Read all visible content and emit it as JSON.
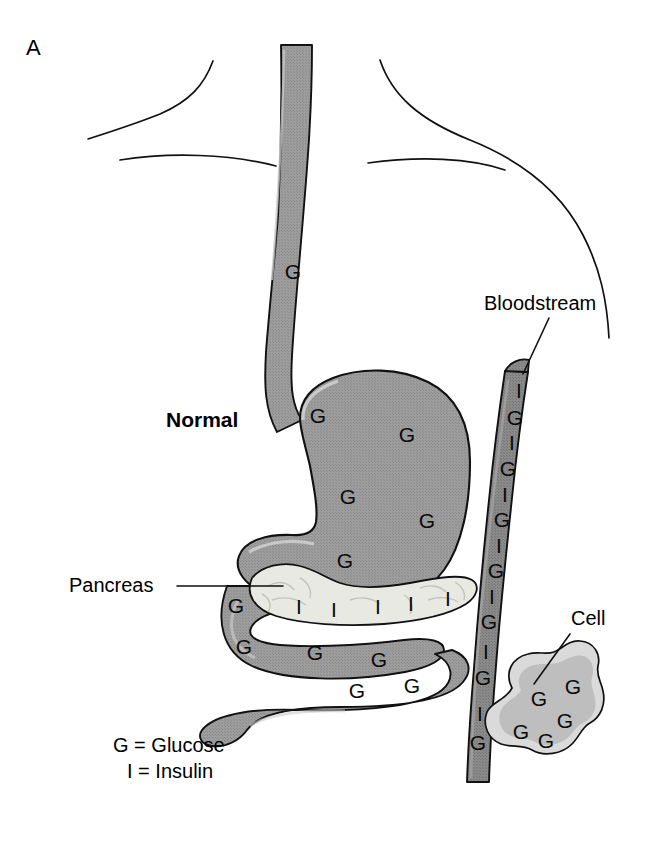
{
  "figure": {
    "panel_letter": "A",
    "condition_label": "Normal",
    "background_color": "#ffffff",
    "line_color": "#111111"
  },
  "labels": {
    "pancreas": "Pancreas",
    "bloodstream": "Bloodstream",
    "cell": "Cell"
  },
  "legend": {
    "glucose": "G = Glucose",
    "insulin": "I = Insulin"
  },
  "symbols": {
    "glucose": "G",
    "insulin": "I"
  },
  "colors": {
    "organ_gray": "#9d9d9d",
    "organ_gray_light": "#b5b5b5",
    "vessel_gray": "#8a8a8a",
    "pancreas_fill": "#e8e8e4",
    "cell_outer": "#d8d8d8",
    "cell_inner": "#bdbdbd",
    "outline": "#111111"
  },
  "structures": {
    "esophagus": {
      "name": "esophagus",
      "glucose_count": 1
    },
    "stomach": {
      "name": "stomach",
      "glucose_count": 5
    },
    "pancreas": {
      "name": "pancreas",
      "insulin_count": 5,
      "glucose_count": 1
    },
    "intestine": {
      "name": "intestine",
      "glucose_count": 5
    },
    "bloodstream": {
      "name": "bloodstream",
      "pairs": 7,
      "pattern": "I G alternating"
    },
    "cell": {
      "name": "cell",
      "glucose_count": 5
    }
  },
  "markers": {
    "esophagus_glucose": [
      {
        "x": 293,
        "y": 273,
        "t": "G"
      }
    ],
    "stomach_glucose": [
      {
        "x": 318,
        "y": 417,
        "t": "G"
      },
      {
        "x": 407,
        "y": 436,
        "t": "G"
      },
      {
        "x": 348,
        "y": 498,
        "t": "G"
      },
      {
        "x": 427,
        "y": 522,
        "t": "G"
      },
      {
        "x": 345,
        "y": 562,
        "t": "G"
      }
    ],
    "pancreas_insulin": [
      {
        "x": 299,
        "y": 608,
        "t": "I"
      },
      {
        "x": 334,
        "y": 611,
        "t": "I"
      },
      {
        "x": 378,
        "y": 608,
        "t": "I"
      },
      {
        "x": 411,
        "y": 605,
        "t": "I"
      },
      {
        "x": 448,
        "y": 600,
        "t": "I"
      }
    ],
    "intestine_glucose": [
      {
        "x": 236,
        "y": 607,
        "t": "G"
      },
      {
        "x": 244,
        "y": 648,
        "t": "G"
      },
      {
        "x": 315,
        "y": 654,
        "t": "G"
      },
      {
        "x": 379,
        "y": 661,
        "t": "G"
      },
      {
        "x": 357,
        "y": 692,
        "t": "G"
      },
      {
        "x": 412,
        "y": 687,
        "t": "G"
      }
    ],
    "bloodstream_letters": [
      {
        "x": 519,
        "y": 392,
        "t": "I"
      },
      {
        "x": 515,
        "y": 419,
        "t": "G"
      },
      {
        "x": 512,
        "y": 444,
        "t": "I"
      },
      {
        "x": 508,
        "y": 470,
        "t": "G"
      },
      {
        "x": 505,
        "y": 496,
        "t": "I"
      },
      {
        "x": 502,
        "y": 521,
        "t": "G"
      },
      {
        "x": 499,
        "y": 547,
        "t": "I"
      },
      {
        "x": 496,
        "y": 572,
        "t": "G"
      },
      {
        "x": 492,
        "y": 598,
        "t": "I"
      },
      {
        "x": 489,
        "y": 623,
        "t": "G"
      },
      {
        "x": 486,
        "y": 653,
        "t": "I"
      },
      {
        "x": 483,
        "y": 679,
        "t": "G"
      },
      {
        "x": 480,
        "y": 715,
        "t": "I"
      },
      {
        "x": 478,
        "y": 744,
        "t": "G"
      }
    ],
    "cell_glucose": [
      {
        "x": 539,
        "y": 700,
        "t": "G"
      },
      {
        "x": 573,
        "y": 688,
        "t": "G"
      },
      {
        "x": 565,
        "y": 722,
        "t": "G"
      },
      {
        "x": 521,
        "y": 733,
        "t": "G"
      },
      {
        "x": 546,
        "y": 742,
        "t": "G"
      }
    ]
  }
}
